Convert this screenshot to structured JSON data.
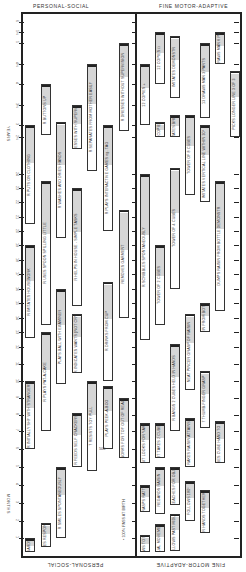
{
  "chart_data": {
    "type": "table",
    "orientation": "rotated 90 degrees; age axis vertical, youngest at bottom",
    "sections": [
      "PERSONAL-SOCIAL",
      "FINE MOTOR-ADAPTIVE"
    ],
    "axis": {
      "months_label": "MONTHS",
      "years_label": "YEARS",
      "month_ticks": [
        1,
        2,
        3,
        4,
        5,
        6,
        7,
        8,
        9,
        10,
        11,
        12,
        13,
        14,
        15,
        16,
        17,
        18,
        19,
        20,
        21,
        22,
        23,
        24
      ],
      "year_ticks": [
        "2½",
        "3",
        "3½",
        "4",
        "4½",
        "5",
        "5½",
        "6"
      ]
    },
    "legend_note": "• 100% PASS AT BIRTH",
    "note_500": "500",
    "items_personal_social": [
      {
        "label": "R REGARDS FACE",
        "start": 0.2,
        "end": 1.0,
        "col": 0
      },
      {
        "label": "R SMILES RESPONSIVELY",
        "start": 0.5,
        "end": 1.9,
        "col": 1
      },
      {
        "label": "R SMILES SPONTANEOUSLY",
        "start": 1.0,
        "end": 5.0,
        "col": 2
      },
      {
        "label": "R FEEDS SELF CRACKERS",
        "start": 5.0,
        "end": 8.1,
        "col": 3
      },
      {
        "label": "7 RESISTS TOY PULL",
        "start": 4.8,
        "end": 10.0,
        "col": 4
      },
      {
        "label": "PLAYS PEEK-A-BOO",
        "start": 6.0,
        "end": 9.7,
        "col": 5
      },
      {
        "label": "WORKS FOR TOY OUT OF REACH",
        "start": 5.5,
        "end": 9.0,
        "col": 6
      },
      {
        "label": "R INITIALLY SHY WITH STRANGERS",
        "start": 6.0,
        "end": 10.0,
        "col": 0
      },
      {
        "label": "R PLAYS PAT-A-CAKE",
        "start": 7.0,
        "end": 13.0,
        "col": 1
      },
      {
        "label": "PLAYS BALL WITH EXAMINER",
        "start": 9.8,
        "end": 16.0,
        "col": 2
      },
      {
        "label": "R INDICATES WANTS (NOT CRY)",
        "start": 10.5,
        "end": 14.3,
        "col": 3
      },
      {
        "label": "R DRINKS FROM CUP",
        "start": 10.0,
        "end": 16.5,
        "col": 5
      },
      {
        "label": "R IMITATES HOUSEWORK",
        "start": 12.6,
        "end": 19.0,
        "col": 0
      },
      {
        "label": "R USES SPOON SPILLING LITTLE",
        "start": 13.5,
        "end": 23.5,
        "col": 1
      },
      {
        "label": "R HELPS IN HOUSE - SIMPLE TASKS",
        "start": 14.8,
        "end": 23.0,
        "col": 3
      },
      {
        "label": "REMOVES GARMENT",
        "start": 14.0,
        "end": 21.5,
        "col": 6
      },
      {
        "label": "R PUTS ON CLOTHING",
        "start": 20.5,
        "end": 36.0,
        "col": 0
      },
      {
        "label": "R WASHES AND DRIES HANDS",
        "start": 19.5,
        "end": 37.0,
        "col": 2
      },
      {
        "label": "R PLAYS INTERACTIVE GAMES eg. TAG",
        "start": 20.0,
        "end": 36.0,
        "col": 5
      },
      {
        "label": "R SEPARATES FROM MOTHER EASILY",
        "start": 24.5,
        "end": 54.0,
        "col": 4
      },
      {
        "label": "R DRESSES WITH SUPERVISION",
        "start": 28.0,
        "end": 42.0,
        "col": 3
      },
      {
        "label": "R BUTTONS UP",
        "start": 31.0,
        "end": 48.0,
        "col": 1
      },
      {
        "label": "R DRESSES WITHOUT SUPERVISION",
        "start": 33.0,
        "end": 60.0,
        "col": 6
      }
    ],
    "items_fine_motor_adaptive": [
      {
        "label": "FOLLOWS TO MIDLINE",
        "start": 0.2,
        "end": 1.2,
        "col": 0
      },
      {
        "label": "EQUAL MOVEMENTS",
        "start": 0.2,
        "end": 1.8,
        "col": 1
      },
      {
        "label": "FOLLOWS PAST MIDLINE",
        "start": 0.3,
        "end": 2.4,
        "col": 2
      },
      {
        "label": "GRASPS RATTLE",
        "start": 2.5,
        "end": 4.0,
        "col": 0
      },
      {
        "label": "REGARDS RAISIN",
        "start": 2.4,
        "end": 5.0,
        "col": 1
      },
      {
        "label": "R REACHES FOR OBJECT",
        "start": 2.9,
        "end": 5.0,
        "col": 2
      },
      {
        "label": "FOLLOWS 180°",
        "start": 2.0,
        "end": 4.2,
        "col": 3
      },
      {
        "label": "R HANDS TOGETHER",
        "start": 1.3,
        "end": 3.7,
        "col": 4
      },
      {
        "label": "SIT LOOKS FOR YARN",
        "start": 5.2,
        "end": 7.5,
        "col": 0
      },
      {
        "label": "SIT TAKES 2 CUBES",
        "start": 5.5,
        "end": 7.5,
        "col": 1
      },
      {
        "label": "RAKES RAISIN ATTAINS",
        "start": 5.0,
        "end": 7.8,
        "col": 3
      },
      {
        "label": "PASSES CUBE HAND TO HAND",
        "start": 5.2,
        "end": 7.6,
        "col": 5
      },
      {
        "label": "R BANGS 2 CUBES HELD IN HANDS",
        "start": 7.0,
        "end": 12.2,
        "col": 2
      },
      {
        "label": "7 THUMB-FINGER GRASP",
        "start": 7.2,
        "end": 10.6,
        "col": 4
      },
      {
        "label": "NEAT PINCER GRASP OF RAISIN",
        "start": 9.5,
        "end": 14.3,
        "col": 3
      },
      {
        "label": "R SCRIBBLES SPONTANEOUSLY",
        "start": 12.5,
        "end": 24.0,
        "col": 0
      },
      {
        "label": "TOWER OF 2 CUBES",
        "start": 13.5,
        "end": 19.0,
        "col": 1
      },
      {
        "label": "DUMPS RAISIN FROM BOTTLE - SPONT",
        "start": 13.0,
        "end": 15.0,
        "col": 4
      },
      {
        "label": "DUMPS RAISIN FROM BOTTLE DEMONSTR",
        "start": 14.5,
        "end": 23.5,
        "col": 5
      },
      {
        "label": "TOWER OF 4 CUBES",
        "start": 16.0,
        "end": 25.0,
        "col": 2
      },
      {
        "label": "IMITATES VERTICAL LINE WITHIN 30°",
        "start": 22.0,
        "end": 36.0,
        "col": 4
      },
      {
        "label": "TOWER OF 8 CUBES",
        "start": 22.5,
        "end": 39.0,
        "col": 3
      },
      {
        "label": "IMITATES BRIDGE",
        "start": 30.0,
        "end": 39.0,
        "col": 2
      },
      {
        "label": "12 COPIES O",
        "start": 30.0,
        "end": 37.0,
        "col": 1
      },
      {
        "label": "12 COPIES +",
        "start": 36.0,
        "end": 54.0,
        "col": 0
      },
      {
        "label": "PICKS LONGER LINE 3 OF 3",
        "start": 30.0,
        "end": 52.0,
        "col": 6
      },
      {
        "label": "13 DRAWS MAN 3 PARTS",
        "start": 38.0,
        "end": 60.0,
        "col": 4
      },
      {
        "label": "IMITATES DEMONSTR",
        "start": 44.0,
        "end": 64.0,
        "col": 2
      },
      {
        "label": "12 COPIES □",
        "start": 48.0,
        "end": 66.0,
        "col": 1
      },
      {
        "label": "13 DRAWS MAN 6 PARTS",
        "start": 54.0,
        "end": 66.0,
        "col": 5
      }
    ]
  },
  "headers": {
    "top_left": "PERSONAL-SOCIAL",
    "top_right": "FINE MOTOR-ADAPTIVE",
    "bottom_left": "PERSONAL-SOCIAL",
    "bottom_right": "FINE MOTOR-ADAPTIVE"
  }
}
